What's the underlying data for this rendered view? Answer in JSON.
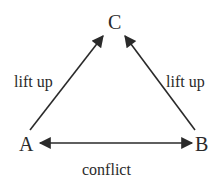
{
  "diagram": {
    "nodes": [
      {
        "id": "C",
        "label": "C"
      },
      {
        "id": "A",
        "label": "A"
      },
      {
        "id": "B",
        "label": "B"
      }
    ],
    "edges": [
      {
        "from": "A",
        "to": "C",
        "label": "lift up",
        "direction": "forward"
      },
      {
        "from": "B",
        "to": "C",
        "label": "lift up",
        "direction": "forward"
      },
      {
        "from": "A",
        "to": "B",
        "label": "conflict",
        "direction": "both"
      }
    ],
    "colors": {
      "line": "#2a2a2a",
      "text": "#2a2a2a",
      "background": "#ffffff"
    }
  }
}
